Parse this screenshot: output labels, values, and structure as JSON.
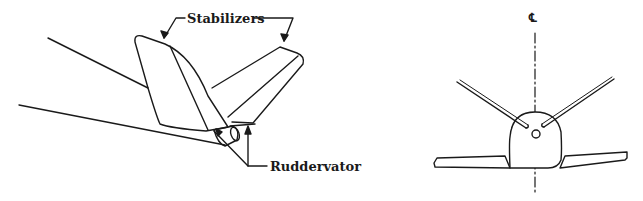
{
  "diagram": {
    "type": "technical-illustration",
    "left_view": {
      "name": "perspective view of tail",
      "labels": {
        "stabilizers": "Stabilizers",
        "ruddervator": "Ruddervator"
      }
    },
    "right_view": {
      "name": "rear view of aircraft",
      "labels": {
        "centerline": "℄"
      }
    },
    "colors": {
      "line": "#1a1a1a",
      "background": "#ffffff"
    }
  }
}
